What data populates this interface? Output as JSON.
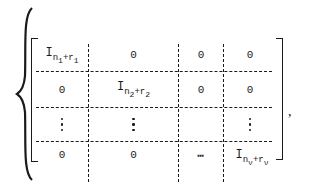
{
  "figure": {
    "type": "block_matrix",
    "delimiters": {
      "left_outer": "{",
      "left": "[",
      "right": "]",
      "trailing": ","
    },
    "rows": [
      [
        {
          "kind": "ident",
          "base": "I",
          "sub_n": "n",
          "sub_n_idx": "1",
          "plus": "+",
          "sub_r": "r",
          "sub_r_idx": "1"
        },
        {
          "kind": "text",
          "value": "0"
        },
        {
          "kind": "text",
          "value": "0"
        },
        {
          "kind": "hdots",
          "value": "⋯"
        },
        {
          "kind": "text",
          "value": "0"
        }
      ],
      [
        {
          "kind": "text",
          "value": "0"
        },
        {
          "kind": "ident",
          "base": "I",
          "sub_n": "n",
          "sub_n_idx": "2",
          "plus": "+",
          "sub_r": "r",
          "sub_r_idx": "2"
        },
        {
          "kind": "text",
          "value": "0"
        },
        {
          "kind": "hdots",
          "value": "⋯"
        },
        {
          "kind": "text",
          "value": "0"
        }
      ],
      [
        {
          "kind": "vdots",
          "value": "⋮"
        },
        {
          "kind": "vdots",
          "value": "⋮"
        },
        {
          "kind": "empty",
          "value": ""
        },
        {
          "kind": "empty",
          "value": ""
        },
        {
          "kind": "vdots",
          "value": "⋮"
        }
      ],
      [
        {
          "kind": "text",
          "value": "0"
        },
        {
          "kind": "text",
          "value": "0"
        },
        {
          "kind": "text",
          "value": "0"
        },
        {
          "kind": "hdots",
          "value": "⋯"
        },
        {
          "kind": "ident",
          "base": "I",
          "sub_n": "n",
          "sub_n_idx": "ν",
          "plus": "+",
          "sub_r": "r",
          "sub_r_idx": "ν"
        }
      ]
    ],
    "cells": {
      "r0c0": {
        "base": "I",
        "n": "n",
        "ni": "1",
        "plus": "+",
        "r": "r",
        "ri": "1"
      },
      "r0c1": "0",
      "r0c2": "0",
      "r0c3": "⋯",
      "r0c4": "0",
      "r1c0": "0",
      "r1c1": {
        "base": "I",
        "n": "n",
        "ni": "2",
        "plus": "+",
        "r": "r",
        "ri": "2"
      },
      "r1c2": "0",
      "r1c3": "⋯",
      "r1c4": "0",
      "r3c0": "0",
      "r3c1": "0",
      "r3c2": "0",
      "r3c3": "⋯",
      "r3c4": {
        "base": "I",
        "n": "n",
        "ni": "ν",
        "plus": "+",
        "r": "r",
        "ri": "ν"
      }
    },
    "comma": ","
  }
}
